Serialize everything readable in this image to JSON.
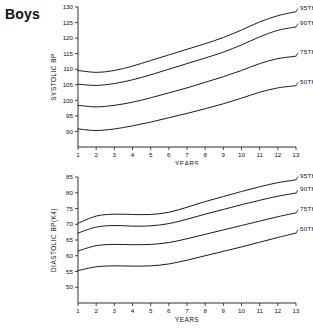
{
  "title": "Boys",
  "charts": [
    {
      "id": "systolic",
      "chart_type": "line",
      "ylabel": "SYSTOLIC BP",
      "xlabel": "YEARS",
      "xlim": [
        1,
        13
      ],
      "ylim": [
        88,
        130
      ],
      "xticks": [
        1,
        2,
        3,
        4,
        5,
        6,
        7,
        8,
        9,
        10,
        11,
        12,
        13
      ],
      "yticks": [
        90,
        95,
        100,
        105,
        110,
        115,
        120,
        125,
        130
      ],
      "grid": false,
      "legend_position": "right-inline",
      "series": [
        {
          "name": "95TH",
          "x": [
            1,
            2,
            3,
            4,
            5,
            6,
            7,
            8,
            9,
            10,
            11,
            12,
            13
          ],
          "values": [
            109.6,
            109.0,
            109.6,
            111.0,
            112.8,
            114.6,
            116.4,
            118.2,
            120.2,
            122.6,
            125.2,
            127.2,
            128.5
          ]
        },
        {
          "name": "90TH",
          "x": [
            1,
            2,
            3,
            4,
            5,
            6,
            7,
            8,
            9,
            10,
            11,
            12,
            13
          ],
          "values": [
            105.2,
            104.8,
            105.4,
            106.6,
            108.2,
            110.0,
            111.8,
            113.6,
            115.5,
            117.8,
            120.4,
            122.5,
            123.6
          ]
        },
        {
          "name": "75TH",
          "x": [
            1,
            2,
            3,
            4,
            5,
            6,
            7,
            8,
            9,
            10,
            11,
            12,
            13
          ],
          "values": [
            98.4,
            97.9,
            98.4,
            99.4,
            100.8,
            102.4,
            104.0,
            105.8,
            107.6,
            109.6,
            111.8,
            113.4,
            114.2
          ]
        },
        {
          "name": "50TH",
          "x": [
            1,
            2,
            3,
            4,
            5,
            6,
            7,
            8,
            9,
            10,
            11,
            12,
            13
          ],
          "values": [
            90.8,
            90.3,
            90.8,
            91.8,
            93.0,
            94.4,
            95.8,
            97.3,
            98.9,
            100.7,
            102.6,
            104.0,
            104.7
          ]
        }
      ]
    },
    {
      "id": "diastolic",
      "chart_type": "line",
      "ylabel": "DIASTOLIC BP(K4)",
      "xlabel": "YEARS",
      "xlim": [
        1,
        13
      ],
      "ylim": [
        48,
        85
      ],
      "xticks": [
        1,
        2,
        3,
        4,
        5,
        6,
        7,
        8,
        9,
        10,
        11,
        12,
        13
      ],
      "yticks": [
        50,
        55,
        60,
        65,
        70,
        75,
        80,
        85
      ],
      "grid": false,
      "legend_position": "right-inline",
      "series": [
        {
          "name": "95TH",
          "x": [
            1,
            2,
            3,
            4,
            5,
            6,
            7,
            8,
            9,
            10,
            11,
            12,
            13
          ],
          "values": [
            70.3,
            72.6,
            73.2,
            73.1,
            73.1,
            73.8,
            75.4,
            77.2,
            78.8,
            80.4,
            81.9,
            83.2,
            84.1
          ]
        },
        {
          "name": "90TH",
          "x": [
            1,
            2,
            3,
            4,
            5,
            6,
            7,
            8,
            9,
            10,
            11,
            12,
            13
          ],
          "values": [
            67.2,
            69.1,
            69.6,
            69.4,
            69.5,
            70.2,
            71.6,
            73.2,
            74.7,
            76.2,
            77.6,
            78.9,
            79.9
          ]
        },
        {
          "name": "75TH",
          "x": [
            1,
            2,
            3,
            4,
            5,
            6,
            7,
            8,
            9,
            10,
            11,
            12,
            13
          ],
          "values": [
            61.5,
            63.2,
            63.6,
            63.5,
            63.6,
            64.2,
            65.4,
            66.8,
            68.2,
            69.6,
            71.0,
            72.4,
            73.6
          ]
        },
        {
          "name": "50TH",
          "x": [
            1,
            2,
            3,
            4,
            5,
            6,
            7,
            8,
            9,
            10,
            11,
            12,
            13
          ],
          "values": [
            55.3,
            56.5,
            56.8,
            56.7,
            56.8,
            57.4,
            58.6,
            60.0,
            61.4,
            62.8,
            64.3,
            65.8,
            67.2
          ]
        }
      ]
    }
  ],
  "chart_data": [
    {
      "type": "line",
      "title": "Boys — Systolic BP percentiles by age",
      "xlabel": "YEARS",
      "ylabel": "SYSTOLIC BP",
      "x": [
        1,
        2,
        3,
        4,
        5,
        6,
        7,
        8,
        9,
        10,
        11,
        12,
        13
      ],
      "xlim": [
        1,
        13
      ],
      "ylim": [
        88,
        130
      ],
      "grid": false,
      "legend_position": "right-inline",
      "series": [
        {
          "name": "95TH",
          "values": [
            109.6,
            109.0,
            109.6,
            111.0,
            112.8,
            114.6,
            116.4,
            118.2,
            120.2,
            122.6,
            125.2,
            127.2,
            128.5
          ]
        },
        {
          "name": "90TH",
          "values": [
            105.2,
            104.8,
            105.4,
            106.6,
            108.2,
            110.0,
            111.8,
            113.6,
            115.5,
            117.8,
            120.4,
            122.5,
            123.6
          ]
        },
        {
          "name": "75TH",
          "values": [
            98.4,
            97.9,
            98.4,
            99.4,
            100.8,
            102.4,
            104.0,
            105.8,
            107.6,
            109.6,
            111.8,
            113.4,
            114.2
          ]
        },
        {
          "name": "50TH",
          "values": [
            90.8,
            90.3,
            90.8,
            91.8,
            93.0,
            94.4,
            95.8,
            97.3,
            98.9,
            100.7,
            102.6,
            104.0,
            104.7
          ]
        }
      ]
    },
    {
      "type": "line",
      "title": "Boys — Diastolic BP (K4) percentiles by age",
      "xlabel": "YEARS",
      "ylabel": "DIASTOLIC BP(K4)",
      "x": [
        1,
        2,
        3,
        4,
        5,
        6,
        7,
        8,
        9,
        10,
        11,
        12,
        13
      ],
      "xlim": [
        1,
        13
      ],
      "ylim": [
        48,
        85
      ],
      "grid": false,
      "legend_position": "right-inline",
      "series": [
        {
          "name": "95TH",
          "values": [
            70.3,
            72.6,
            73.2,
            73.1,
            73.1,
            73.8,
            75.4,
            77.2,
            78.8,
            80.4,
            81.9,
            83.2,
            84.1
          ]
        },
        {
          "name": "90TH",
          "values": [
            67.2,
            69.1,
            69.6,
            69.4,
            69.5,
            70.2,
            71.6,
            73.2,
            74.7,
            76.2,
            77.6,
            78.9,
            79.9
          ]
        },
        {
          "name": "75TH",
          "values": [
            61.5,
            63.2,
            63.6,
            63.5,
            63.6,
            64.2,
            65.4,
            66.8,
            68.2,
            69.6,
            71.0,
            72.4,
            73.6
          ]
        },
        {
          "name": "50TH",
          "values": [
            55.3,
            56.5,
            56.8,
            56.7,
            56.8,
            57.4,
            58.6,
            60.0,
            61.4,
            62.8,
            64.3,
            65.8,
            67.2
          ]
        }
      ]
    }
  ]
}
